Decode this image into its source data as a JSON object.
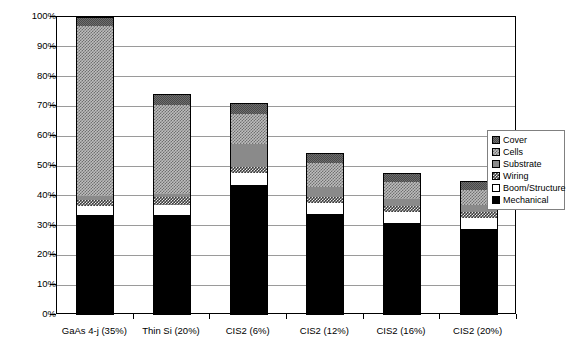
{
  "chart_data": {
    "type": "bar",
    "subtype": "stacked-bar-100",
    "title": "",
    "xlabel": "",
    "ylabel": "",
    "ylim": [
      0,
      100
    ],
    "grid": true,
    "legend_position": "right",
    "y_tick_labels": [
      "0%",
      "10%",
      "20%",
      "30%",
      "40%",
      "50%",
      "60%",
      "70%",
      "80%",
      "90%",
      "100%"
    ],
    "y_tick_values": [
      0,
      10,
      20,
      30,
      40,
      50,
      60,
      70,
      80,
      90,
      100
    ],
    "categories": [
      "GaAs 4-j (35%)",
      "Thin Si (20%)",
      "CIS2 (6%)",
      "CIS2 (12%)",
      "CIS2 (16%)",
      "CIS2 (20%)"
    ],
    "series": [
      {
        "name": "Mechanical",
        "color": "#000000",
        "values": [
          33.5,
          33.5,
          43.5,
          34.0,
          31.0,
          29.0
        ]
      },
      {
        "name": "Boom/Structure",
        "color": "#ffffff",
        "values": [
          3.0,
          3.5,
          4.0,
          3.5,
          3.5,
          3.5
        ]
      },
      {
        "name": "Wiring",
        "color": "#3b3b3b",
        "values": [
          2.0,
          2.5,
          2.0,
          2.0,
          2.0,
          2.0
        ]
      },
      {
        "name": "Substrate",
        "color": "#8a8a8a",
        "values": [
          1.5,
          1.0,
          8.0,
          3.5,
          2.5,
          2.5
        ]
      },
      {
        "name": "Cells",
        "color": "#bdbdbd",
        "values": [
          57.0,
          30.0,
          10.0,
          8.0,
          5.5,
          5.0
        ]
      },
      {
        "name": "Cover",
        "color": "#6e6e6e",
        "values": [
          3.0,
          3.5,
          3.5,
          3.5,
          3.0,
          3.0
        ]
      }
    ],
    "totals": [
      100.0,
      74.0,
      71.0,
      54.5,
      47.5,
      45.0
    ]
  },
  "legend": {
    "items": [
      {
        "label": "Cover",
        "swatch": "cover-swatch-icon"
      },
      {
        "label": "Cells",
        "swatch": "cells-swatch-icon"
      },
      {
        "label": "Substrate",
        "swatch": "substrate-swatch-icon"
      },
      {
        "label": "Wiring",
        "swatch": "wiring-swatch-icon"
      },
      {
        "label": "Boom/Structure",
        "swatch": "boom-swatch-icon"
      },
      {
        "label": "Mechanical",
        "swatch": "mechanical-swatch-icon"
      }
    ]
  }
}
